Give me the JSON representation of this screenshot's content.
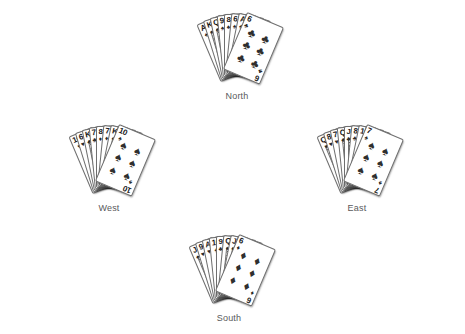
{
  "diagram": {
    "type": "bridge-deal-hand-diagram",
    "background": "#ffffff",
    "card_face_color": "#ffffff",
    "card_border_color": "#6f6f6f",
    "pip_color": "#2f2f2f",
    "label_color": "#59595b"
  },
  "suits": {
    "spade": "♠",
    "heart": "♥",
    "club": "♣",
    "diamond": "♦"
  },
  "hands": {
    "north": {
      "label": "North",
      "cards": [
        {
          "rank": "A",
          "suit": "♠",
          "face": false
        },
        {
          "rank": "K",
          "suit": "♠",
          "face": true
        },
        {
          "rank": "Q",
          "suit": "♠",
          "face": true
        },
        {
          "rank": "9",
          "suit": "♠",
          "face": false
        },
        {
          "rank": "8",
          "suit": "♠",
          "face": false
        },
        {
          "rank": "6",
          "suit": "♠",
          "face": false
        },
        {
          "rank": "A",
          "suit": "♣",
          "face": false
        },
        {
          "rank": "K",
          "suit": "♣",
          "face": true
        },
        {
          "rank": "6",
          "suit": "♣",
          "face": false
        }
      ]
    },
    "west": {
      "label": "West",
      "cards": [
        {
          "rank": "10",
          "suit": "♥",
          "face": false
        },
        {
          "rank": "6",
          "suit": "♥",
          "face": false
        },
        {
          "rank": "K",
          "suit": "♣",
          "face": true
        },
        {
          "rank": "7",
          "suit": "♣",
          "face": false
        },
        {
          "rank": "8",
          "suit": "♦",
          "face": false
        },
        {
          "rank": "7",
          "suit": "♦",
          "face": false
        },
        {
          "rank": "K",
          "suit": "♠",
          "face": true
        },
        {
          "rank": "J",
          "suit": "♠",
          "face": true
        },
        {
          "rank": "10",
          "suit": "♠",
          "face": false
        }
      ]
    },
    "east": {
      "label": "East",
      "cards": [
        {
          "rank": "Q",
          "suit": "♥",
          "face": true
        },
        {
          "rank": "8",
          "suit": "♥",
          "face": false
        },
        {
          "rank": "7",
          "suit": "♥",
          "face": false
        },
        {
          "rank": "Q",
          "suit": "♣",
          "face": true
        },
        {
          "rank": "J",
          "suit": "♣",
          "face": true
        },
        {
          "rank": "8",
          "suit": "♣",
          "face": false
        },
        {
          "rank": "10",
          "suit": "♦",
          "face": false
        },
        {
          "rank": "A",
          "suit": "♦",
          "face": true
        },
        {
          "rank": "7",
          "suit": "♠",
          "face": false
        }
      ]
    },
    "south": {
      "label": "South",
      "cards": [
        {
          "rank": "J",
          "suit": "♠",
          "face": true
        },
        {
          "rank": "9",
          "suit": "♥",
          "face": false
        },
        {
          "rank": "A",
          "suit": "♥",
          "face": false
        },
        {
          "rank": "10",
          "suit": "♣",
          "face": false
        },
        {
          "rank": "9",
          "suit": "♣",
          "face": false
        },
        {
          "rank": "Q",
          "suit": "♦",
          "face": true
        },
        {
          "rank": "J",
          "suit": "♦",
          "face": true
        },
        {
          "rank": "7",
          "suit": "♦",
          "face": false
        },
        {
          "rank": "6",
          "suit": "♦",
          "face": false
        }
      ]
    }
  }
}
